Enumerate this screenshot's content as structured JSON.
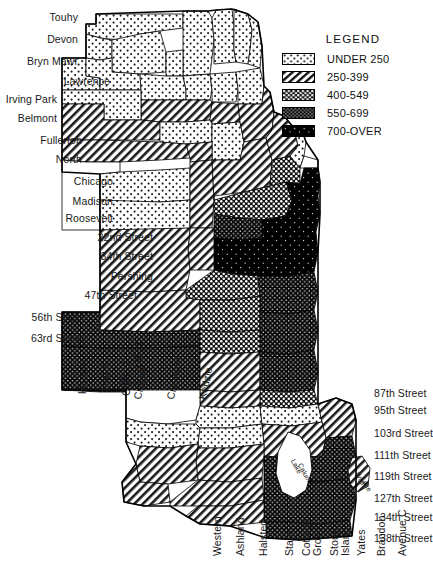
{
  "legend": {
    "title": "LEGEND",
    "items": [
      {
        "label": "UNDER 250",
        "pattern": "sparse-dots-light",
        "swatch_bg": "#ffffff"
      },
      {
        "label": "250-399",
        "pattern": "diagonal-hatch",
        "swatch_bg": "#ffffff"
      },
      {
        "label": "400-549",
        "pattern": "dense-dots-dark",
        "swatch_bg": "#000000"
      },
      {
        "label": "550-699",
        "pattern": "fine-dots-dark",
        "swatch_bg": "#000000"
      },
      {
        "label": "700-OVER",
        "pattern": "solid-black",
        "swatch_bg": "#000000"
      }
    ]
  },
  "labels": {
    "left": [
      {
        "text": "Touhy",
        "x": 78,
        "y": 18
      },
      {
        "text": "Devon",
        "x": 78,
        "y": 40
      },
      {
        "text": "Bryn Mawr",
        "x": 78,
        "y": 62
      },
      {
        "text": "Lawrence",
        "x": 110,
        "y": 82
      },
      {
        "text": "Irving Park",
        "x": 57,
        "y": 100
      },
      {
        "text": "Belmont",
        "x": 57,
        "y": 119
      },
      {
        "text": "Fullerton",
        "x": 82,
        "y": 141
      },
      {
        "text": "North",
        "x": 82,
        "y": 160
      },
      {
        "text": "Chicago",
        "x": 113,
        "y": 182
      },
      {
        "text": "Madison",
        "x": 113,
        "y": 202
      },
      {
        "text": "Roosevelt",
        "x": 113,
        "y": 219
      },
      {
        "text": "22nd Street",
        "x": 153,
        "y": 238
      },
      {
        "text": "34th Street",
        "x": 153,
        "y": 257
      },
      {
        "text": "Pershing",
        "x": 153,
        "y": 277
      },
      {
        "text": "47th Street",
        "x": 137,
        "y": 296
      },
      {
        "text": "56th Street",
        "x": 84,
        "y": 318
      },
      {
        "text": "63rd Street",
        "x": 84,
        "y": 339
      }
    ],
    "right": [
      {
        "text": "87th Street",
        "x": 374,
        "y": 394
      },
      {
        "text": "95th Street",
        "x": 374,
        "y": 411
      },
      {
        "text": "103rd Street",
        "x": 374,
        "y": 434
      },
      {
        "text": "111th Street",
        "x": 374,
        "y": 456
      },
      {
        "text": "119th Street",
        "x": 374,
        "y": 477
      },
      {
        "text": "127th Street",
        "x": 374,
        "y": 499
      },
      {
        "text": "134th Street",
        "x": 374,
        "y": 518
      },
      {
        "text": "138th Street",
        "x": 374,
        "y": 539
      }
    ],
    "vertical_mid": [
      {
        "text": "Harlem",
        "x": 76,
        "y": 394,
        "rot": 90
      },
      {
        "text": "Nagle",
        "x": 98,
        "y": 391,
        "rot": 90
      },
      {
        "text": "Central",
        "x": 120,
        "y": 396,
        "rot": 90
      }
    ],
    "inline_mid": [
      {
        "text": "71",
        "x": 133,
        "y": 348
      },
      {
        "text": "St",
        "x": 133,
        "y": 359
      },
      {
        "text": "79",
        "x": 133,
        "y": 371
      },
      {
        "text": "Street",
        "x": 119,
        "y": 382
      }
    ],
    "vertical_slanted": [
      {
        "text": "Cicero",
        "x": 131,
        "y": 398,
        "rot": 78
      },
      {
        "text": "Crawford",
        "x": 164,
        "y": 398,
        "rot": 78
      },
      {
        "text": "Kedzie",
        "x": 196,
        "y": 398,
        "rot": 78
      }
    ],
    "bottom": [
      {
        "text": "Western",
        "x": 211,
        "y": 556,
        "rot": 90
      },
      {
        "text": "Ashland",
        "x": 234,
        "y": 556,
        "rot": 90
      },
      {
        "text": "Halsted",
        "x": 257,
        "y": 556,
        "rot": 90
      },
      {
        "text": "State",
        "x": 283,
        "y": 556,
        "rot": 90
      },
      {
        "text": "Cottage",
        "x": 300,
        "y": 556,
        "rot": 90
      },
      {
        "text": "Grove",
        "x": 311,
        "y": 556,
        "rot": 90
      },
      {
        "text": "Stony",
        "x": 328,
        "y": 556,
        "rot": 90
      },
      {
        "text": "Island",
        "x": 339,
        "y": 556,
        "rot": 90
      },
      {
        "text": "Yates",
        "x": 355,
        "y": 556,
        "rot": 90
      },
      {
        "text": "Brandon",
        "x": 375,
        "y": 556,
        "rot": 90
      },
      {
        "text": "Avenue C",
        "x": 396,
        "y": 556,
        "rot": 90
      }
    ],
    "water": [
      {
        "text": "Lake",
        "x": 296,
        "y": 458,
        "rot": 62
      },
      {
        "text": "Calumet",
        "x": 303,
        "y": 462,
        "rot": 62
      },
      {
        "text": "Wolf",
        "x": 360,
        "y": 471,
        "rot": 62
      },
      {
        "text": "Lake",
        "x": 366,
        "y": 476,
        "rot": 62
      }
    ]
  },
  "chart_data": {
    "type": "map",
    "title": "LEGEND",
    "map_region": "Chicago, Illinois — community areas choropleth",
    "classes": [
      "UNDER 250",
      "250-399",
      "400-549",
      "550-699",
      "700-OVER"
    ],
    "class_patterns": [
      "sparse-dots-light",
      "diagonal-hatch",
      "dense-dots-dark",
      "fine-dots-dark",
      "solid-black"
    ],
    "axis_streets_west_east": [
      "Harlem",
      "Nagle",
      "Central",
      "Cicero",
      "Crawford",
      "Kedzie",
      "Western",
      "Ashland",
      "Halsted",
      "State",
      "Cottage Grove",
      "Stony Island",
      "Yates",
      "Brandon",
      "Avenue C"
    ],
    "axis_streets_north_south": [
      "Touhy",
      "Devon",
      "Bryn Mawr",
      "Lawrence",
      "Irving Park",
      "Belmont",
      "Fullerton",
      "North",
      "Chicago",
      "Madison",
      "Roosevelt",
      "22nd Street",
      "34th Street",
      "Pershing",
      "47th Street",
      "56th Street",
      "63rd Street",
      "71 St",
      "79 Street",
      "87th Street",
      "95th Street",
      "103rd Street",
      "111th Street",
      "119th Street",
      "127th Street",
      "134th Street",
      "138th Street"
    ],
    "water_bodies": [
      "Lake Calumet",
      "Wolf Lake"
    ],
    "grid": false,
    "legend_position": "top-right"
  }
}
